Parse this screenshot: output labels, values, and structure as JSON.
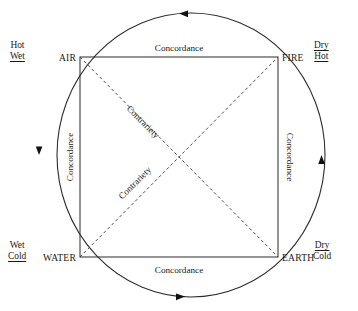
{
  "diagram": {
    "shape_type": "square-of-opposition-in-circle",
    "stroke_color": "#2b2b2b",
    "background_color": "#ffffff",
    "elements": [
      {
        "id": "air",
        "label": "AIR",
        "corner": "top-left",
        "qualities": [
          "Hot",
          "Wet"
        ],
        "underlined": [
          "Wet"
        ]
      },
      {
        "id": "fire",
        "label": "FIRE",
        "corner": "top-right",
        "qualities": [
          "Dry",
          "Hot"
        ],
        "underlined": [
          "Dry",
          "Hot"
        ]
      },
      {
        "id": "water",
        "label": "WATER",
        "corner": "bottom-left",
        "qualities": [
          "Wet",
          "Cold"
        ],
        "underlined": [
          "Cold"
        ]
      },
      {
        "id": "earth",
        "label": "EARTH",
        "corner": "bottom-right",
        "qualities": [
          "Dry",
          "Cold"
        ],
        "underlined": [
          "Dry"
        ]
      }
    ],
    "relations": {
      "concordance_top": "Concordance",
      "concordance_bottom": "Concordance",
      "concordance_left": "Concordance",
      "concordance_right": "Concordance",
      "contrariety_upper": "Contrariety",
      "contrariety_lower": "Contrariety"
    },
    "arrows": [
      {
        "id": "arrow-top",
        "position": "top",
        "direction": "left"
      },
      {
        "id": "arrow-right",
        "position": "right",
        "direction": "up"
      },
      {
        "id": "arrow-bottom",
        "position": "bottom",
        "direction": "right"
      },
      {
        "id": "arrow-left",
        "position": "left",
        "direction": "down"
      }
    ],
    "flow_direction": "counter-clockwise"
  }
}
